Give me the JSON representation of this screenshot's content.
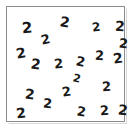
{
  "image": {
    "kind": "counting-stimulus",
    "background_color": "#ffffff",
    "width": 132,
    "height": 133
  },
  "panel": {
    "border_color": "#8b8b8b",
    "fill_color": "#ffffff",
    "shadow_color": "#d8d8d8",
    "left": 6,
    "top": 6,
    "width": 119,
    "height": 116
  },
  "glyphs": {
    "character": "2",
    "color": "#1a1a1a",
    "count": 21,
    "items": [
      {
        "char": "2",
        "x": 15,
        "y": 14,
        "size": 15,
        "rotate": -4
      },
      {
        "char": "2",
        "x": 53,
        "y": 8,
        "size": 14,
        "rotate": 10
      },
      {
        "char": "2",
        "x": 85,
        "y": 14,
        "size": 12,
        "rotate": -6
      },
      {
        "char": "2",
        "x": 108,
        "y": 12,
        "size": 14,
        "rotate": 4
      },
      {
        "char": "2",
        "x": 34,
        "y": 26,
        "size": 13,
        "rotate": -12
      },
      {
        "char": "2",
        "x": 112,
        "y": 30,
        "size": 13,
        "rotate": 6
      },
      {
        "char": "2",
        "x": 9,
        "y": 39,
        "size": 14,
        "rotate": -10
      },
      {
        "char": "2",
        "x": 88,
        "y": 42,
        "size": 13,
        "rotate": 3
      },
      {
        "char": "2",
        "x": 106,
        "y": 44,
        "size": 14,
        "rotate": -8
      },
      {
        "char": "2",
        "x": 24,
        "y": 50,
        "size": 14,
        "rotate": 8
      },
      {
        "char": "2",
        "x": 47,
        "y": 50,
        "size": 13,
        "rotate": -5
      },
      {
        "char": "2",
        "x": 69,
        "y": 48,
        "size": 13,
        "rotate": 12
      },
      {
        "char": "2",
        "x": 95,
        "y": 73,
        "size": 13,
        "rotate": -3
      },
      {
        "char": "2",
        "x": 18,
        "y": 80,
        "size": 14,
        "rotate": 6
      },
      {
        "char": "2",
        "x": 55,
        "y": 78,
        "size": 13,
        "rotate": -9
      },
      {
        "char": "2",
        "x": 36,
        "y": 90,
        "size": 13,
        "rotate": 5
      },
      {
        "char": "2",
        "x": 9,
        "y": 99,
        "size": 14,
        "rotate": -7
      },
      {
        "char": "2",
        "x": 70,
        "y": 98,
        "size": 13,
        "rotate": 9
      },
      {
        "char": "2",
        "x": 93,
        "y": 97,
        "size": 13,
        "rotate": -4
      },
      {
        "char": "2",
        "x": 111,
        "y": 96,
        "size": 14,
        "rotate": 7
      },
      {
        "char": "2",
        "x": 66,
        "y": 66,
        "size": 11,
        "rotate": 14
      }
    ]
  }
}
